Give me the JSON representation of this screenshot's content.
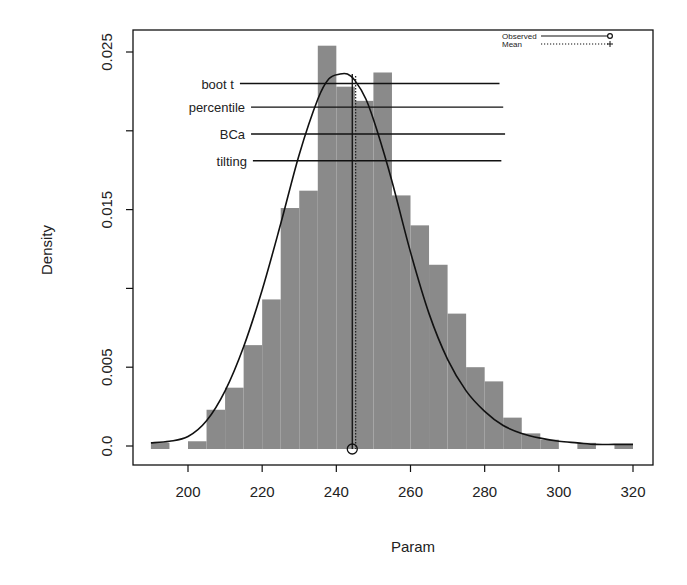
{
  "chart_data": {
    "type": "bar",
    "subtype": "histogram-with-density",
    "title": "",
    "xlabel": "Param",
    "ylabel": "Density",
    "xlim": [
      185,
      322
    ],
    "ylim": [
      -0.0003,
      0.0262
    ],
    "x_ticks": [
      200,
      220,
      240,
      260,
      280,
      300,
      320
    ],
    "x_tick_labels": [
      "200",
      "220",
      "240",
      "260",
      "280",
      "300",
      "320"
    ],
    "y_ticks": [
      0.0,
      0.005,
      0.01,
      0.015,
      0.02,
      0.025
    ],
    "y_tick_labels": [
      "0.0",
      "0.005",
      "",
      "0.015",
      "",
      "0.025"
    ],
    "grid": false,
    "bin_width": 5,
    "histogram": {
      "bin_starts": [
        190,
        195,
        200,
        205,
        210,
        215,
        220,
        225,
        230,
        235,
        240,
        245,
        250,
        255,
        260,
        265,
        270,
        275,
        280,
        285,
        290,
        295,
        300,
        305,
        310,
        315
      ],
      "densities": [
        0.0002,
        0.0,
        0.0003,
        0.0023,
        0.0037,
        0.0064,
        0.0093,
        0.0151,
        0.0162,
        0.0254,
        0.0228,
        0.0219,
        0.0237,
        0.0159,
        0.014,
        0.0115,
        0.0084,
        0.005,
        0.0041,
        0.0018,
        0.0008,
        0.0004,
        0.0,
        0.0002,
        0.0,
        0.0001
      ],
      "fill": "#8a8a8a"
    },
    "density_curve": {
      "x": [
        190,
        195,
        200,
        205,
        210,
        215,
        220,
        225,
        230,
        235,
        238,
        241,
        243,
        245,
        248,
        251,
        255,
        260,
        265,
        270,
        275,
        280,
        285,
        290,
        295,
        300,
        305,
        310,
        315,
        320
      ],
      "y": [
        0.0002,
        0.0003,
        0.0006,
        0.0016,
        0.0035,
        0.0063,
        0.0099,
        0.0141,
        0.0185,
        0.022,
        0.0233,
        0.0236,
        0.0236,
        0.0232,
        0.022,
        0.02,
        0.0168,
        0.0123,
        0.0084,
        0.0055,
        0.0035,
        0.0022,
        0.0013,
        0.0008,
        0.0005,
        0.0003,
        0.0002,
        0.0001,
        0.0001,
        0.0001
      ],
      "color": "#111111"
    },
    "observed": {
      "x": 244.3,
      "label": "Observed",
      "style": "solid",
      "marker": "circle"
    },
    "mean": {
      "x": 245.2,
      "label": "Mean",
      "style": "dotted",
      "marker": "plus"
    },
    "confidence_intervals": [
      {
        "label": "boot t",
        "lower": 214,
        "upper": 284,
        "y": 0.023
      },
      {
        "label": "percentile",
        "lower": 217,
        "upper": 285,
        "y": 0.0215
      },
      {
        "label": "BCa",
        "lower": 217,
        "upper": 285.5,
        "y": 0.0198
      },
      {
        "label": "tilting",
        "lower": 217.5,
        "upper": 284.5,
        "y": 0.0181
      }
    ],
    "legend": {
      "position": "top-right",
      "entries": [
        {
          "label": "Observed",
          "style": "solid",
          "marker": "circle"
        },
        {
          "label": "Mean",
          "style": "dotted",
          "marker": "plus"
        }
      ]
    }
  }
}
